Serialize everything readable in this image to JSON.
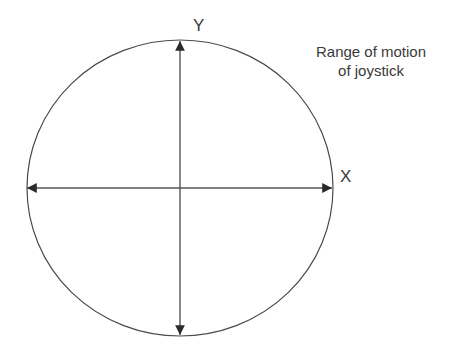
{
  "diagram": {
    "title": "Range of motion of joystick",
    "caption_line1": "Range of motion",
    "caption_line2": "of joystick",
    "x_axis_label": "X",
    "y_axis_label": "Y",
    "colors": {
      "stroke": "#3a3a3a",
      "background": "#ffffff"
    },
    "shapes": {
      "boundary": "circle",
      "axes": [
        "horizontal double-headed arrow",
        "vertical double-headed arrow"
      ]
    }
  }
}
